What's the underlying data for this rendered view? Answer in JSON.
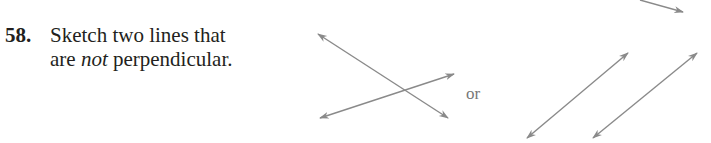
{
  "problem": {
    "number": "58.",
    "line1": "Sketch two lines that",
    "line2_pre": "are ",
    "line2_emph": "not",
    "line2_post": " perpendicular."
  },
  "figure": {
    "separator": "or",
    "line_color": "#8a8a8a",
    "examples": [
      {
        "name": "intersecting-lines",
        "lines": [
          [
            [
              318,
              34
            ],
            [
              448,
              118
            ]
          ],
          [
            [
              320,
              118
            ],
            [
              454,
              74
            ]
          ]
        ]
      },
      {
        "name": "parallel-lines",
        "lines": [
          [
            [
              527,
              138
            ],
            [
              628,
              53
            ]
          ],
          [
            [
              593,
              138
            ],
            [
              697,
              53
            ]
          ]
        ]
      }
    ]
  }
}
